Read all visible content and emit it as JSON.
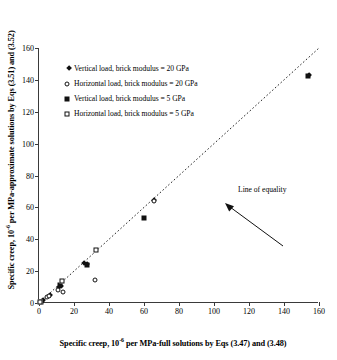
{
  "chart_data": {
    "type": "scatter",
    "title": "",
    "xlabel": "Specific creep, 10^-6 per MPa-full solutions by Eqs (3.47) and (3.48)",
    "ylabel": "Specific creep, 10^-6 per MPa-approximate solutions by Eqs (3.51) and (3.52)",
    "xlim": [
      0,
      160
    ],
    "ylim": [
      0,
      160
    ],
    "xticks": [
      0,
      20,
      40,
      60,
      80,
      100,
      120,
      140,
      160
    ],
    "yticks": [
      0,
      20,
      40,
      60,
      80,
      100,
      120,
      140,
      160
    ],
    "grid": false,
    "legend_position": "upper-left",
    "series": [
      {
        "name": "Vertical load, brick modulus = 20 GPa",
        "marker": "filled-diamond",
        "color": "#111111",
        "points": [
          {
            "x": 0.6,
            "y": 0.5
          },
          {
            "x": 1.2,
            "y": 1.1
          },
          {
            "x": 5.0,
            "y": 4.2
          },
          {
            "x": 10.5,
            "y": 9.5
          },
          {
            "x": 11.5,
            "y": 10.3
          },
          {
            "x": 24.5,
            "y": 24.2
          },
          {
            "x": 26.5,
            "y": 24.0
          },
          {
            "x": 64.5,
            "y": 64.0
          },
          {
            "x": 153.0,
            "y": 142.5
          }
        ]
      },
      {
        "name": "Horizontal load, brick modulus = 20 GPa",
        "marker": "open-circle",
        "color": "#111111",
        "points": [
          {
            "x": 0.8,
            "y": 0.7
          },
          {
            "x": 4.5,
            "y": 3.8
          },
          {
            "x": 5.5,
            "y": 4.4
          },
          {
            "x": 11.0,
            "y": 8.0
          },
          {
            "x": 13.5,
            "y": 6.8
          },
          {
            "x": 32.0,
            "y": 14.5
          },
          {
            "x": 65.5,
            "y": 64.0
          }
        ]
      },
      {
        "name": "Vertical load, brick modulus = 5 GPa",
        "marker": "filled-square",
        "color": "#111111",
        "points": [
          {
            "x": 1.0,
            "y": 0.8
          },
          {
            "x": 11.8,
            "y": 11.0
          },
          {
            "x": 27.5,
            "y": 24.0
          },
          {
            "x": 60.0,
            "y": 53.5
          },
          {
            "x": 153.5,
            "y": 142.5
          }
        ]
      },
      {
        "name": "Horizontal load, brick modulus = 5 GPa",
        "marker": "open-square",
        "color": "#111111",
        "points": [
          {
            "x": 0.5,
            "y": 0.4
          },
          {
            "x": 13.0,
            "y": 13.5
          },
          {
            "x": 32.5,
            "y": 33.0
          }
        ]
      }
    ],
    "reference_line": {
      "label": "Line of equality",
      "style": "dotted",
      "from": {
        "x": 0,
        "y": 0
      },
      "to": {
        "x": 160,
        "y": 160
      }
    },
    "annotations": [
      {
        "text": "Line of equality",
        "points_to": {
          "x": 88,
          "y": 86
        }
      }
    ]
  },
  "axes": {
    "x_title_parts": {
      "pre": "Specific creep, 10",
      "exp": "-6",
      "post": " per MPa-full solutions by Eqs  (3.47) and (3.48)"
    },
    "y_title_parts": {
      "pre": "Specific creep, 10",
      "exp": "-6",
      "post": "  per MPa-approximate solutions by Eqs (3.51) and (3.52)"
    },
    "x_tick_labels": [
      "0",
      "20",
      "40",
      "60",
      "80",
      "100",
      "120",
      "140",
      "160"
    ],
    "y_tick_labels": [
      "0",
      "20",
      "40",
      "60",
      "80",
      "100",
      "120",
      "140",
      "160"
    ]
  },
  "legend": {
    "items": [
      {
        "marker": "filled-diamond",
        "label": "Vertical load, brick modulus = 20 GPa"
      },
      {
        "marker": "open-circle",
        "label": "Horizontal load, brick modulus = 20 GPa"
      },
      {
        "marker": "filled-square",
        "label": "Vertical load, brick modulus = 5 GPa"
      },
      {
        "marker": "open-square",
        "label": "Horizontal load, brick modulus = 5 GPa"
      }
    ]
  },
  "annotation": {
    "line_of_equality": "Line of equality"
  },
  "colors": {
    "marker": "#111111",
    "axis": "#3a3a3a",
    "background": "#ffffff"
  }
}
